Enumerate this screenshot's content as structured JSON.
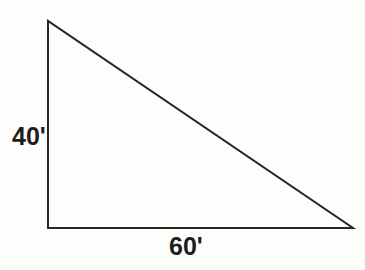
{
  "figure": {
    "type": "right-triangle-diagram",
    "background_color": "#fdfdfc",
    "line_color": "#262626",
    "text_color": "#1d1d1d",
    "line_width": 2,
    "vertices": {
      "apex": [
        48,
        21
      ],
      "bottom_left": [
        48,
        228
      ],
      "bottom_right": [
        353,
        228
      ]
    },
    "labels": {
      "vertical_leg": "40'",
      "horizontal_leg": "60'"
    },
    "edges": [
      {
        "name": "vertical-leg",
        "from": "apex",
        "to": "bottom_left",
        "label": "40'"
      },
      {
        "name": "horizontal-leg",
        "from": "bottom_left",
        "to": "bottom_right",
        "label": "60'"
      },
      {
        "name": "hypotenuse",
        "from": "apex",
        "to": "bottom_right",
        "label": ""
      }
    ]
  },
  "chart_data": {
    "type": "diagram",
    "title": "",
    "shape": "right triangle",
    "categories": [
      "vertical leg",
      "horizontal leg"
    ],
    "values": [
      40,
      60
    ],
    "units": "feet",
    "annotations": [
      "40'",
      "60'"
    ],
    "xlabel": "",
    "ylabel": ""
  }
}
